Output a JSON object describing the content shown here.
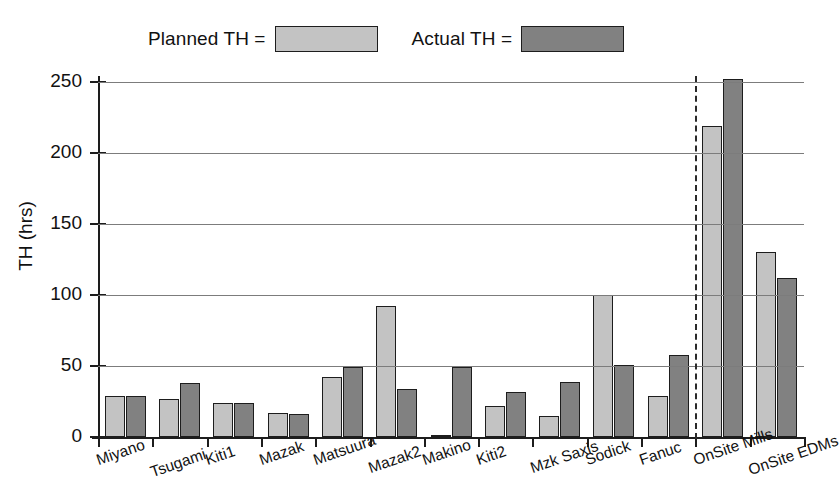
{
  "chart_data": {
    "type": "bar",
    "title": "",
    "xlabel": "",
    "ylabel": "TH (hrs)",
    "ylim": [
      0,
      265
    ],
    "yticks": [
      0,
      50,
      100,
      150,
      200,
      250
    ],
    "ytick_labels": [
      "0",
      "50",
      "100",
      "150",
      "200",
      "250"
    ],
    "grid": true,
    "legend_position": "top",
    "categories": [
      "Miyano",
      "Tsugami",
      "Kiti1",
      "Mazak",
      "Matsuura",
      "Mazak2",
      "Makino",
      "Kiti2",
      "Mzk Saxis",
      "Sodick",
      "Fanuc",
      "OnSite Mills",
      "OnSite EDMs"
    ],
    "series": [
      {
        "name": "Planned TH =",
        "color": "#c3c3c3",
        "values": [
          29,
          27,
          24,
          17,
          42,
          92,
          1,
          22,
          15,
          100,
          29,
          219,
          130
        ]
      },
      {
        "name": "Actual TH =",
        "color": "#818181",
        "values": [
          29,
          38,
          24,
          16,
          49,
          34,
          49,
          32,
          39,
          51,
          58,
          252,
          112
        ]
      }
    ],
    "annotations": [
      {
        "type": "vertical-dashed-divider",
        "after_category": "Fanuc",
        "note": "separates individual machines from OnSite groupings"
      }
    ]
  },
  "legend": {
    "entries": [
      {
        "label": "Planned TH =",
        "swatch_color": "#c3c3c3"
      },
      {
        "label": "Actual TH =",
        "swatch_color": "#818181"
      }
    ]
  },
  "axes": {
    "y_axis_title": "TH (hrs)"
  }
}
